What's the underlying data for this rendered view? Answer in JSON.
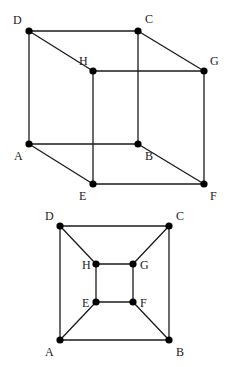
{
  "diagrams": [
    {
      "name": "cube-3d",
      "vertices": [
        {
          "id": "A",
          "x": 29,
          "y": 144,
          "lx": 14,
          "ly": 160
        },
        {
          "id": "B",
          "x": 138,
          "y": 144,
          "lx": 145,
          "ly": 160
        },
        {
          "id": "C",
          "x": 138,
          "y": 31,
          "lx": 145,
          "ly": 23
        },
        {
          "id": "D",
          "x": 29,
          "y": 31,
          "lx": 13,
          "ly": 24
        },
        {
          "id": "E",
          "x": 93,
          "y": 184,
          "lx": 79,
          "ly": 200
        },
        {
          "id": "F",
          "x": 204,
          "y": 184,
          "lx": 210,
          "ly": 200
        },
        {
          "id": "G",
          "x": 204,
          "y": 71,
          "lx": 210,
          "ly": 65
        },
        {
          "id": "H",
          "x": 93,
          "y": 71,
          "lx": 79,
          "ly": 65
        }
      ],
      "edges": [
        [
          "A",
          "B"
        ],
        [
          "B",
          "C"
        ],
        [
          "C",
          "D"
        ],
        [
          "D",
          "A"
        ],
        [
          "E",
          "F"
        ],
        [
          "F",
          "G"
        ],
        [
          "G",
          "H"
        ],
        [
          "H",
          "E"
        ],
        [
          "A",
          "E"
        ],
        [
          "B",
          "F"
        ],
        [
          "C",
          "G"
        ],
        [
          "D",
          "H"
        ]
      ]
    },
    {
      "name": "cube-planar",
      "vertices": [
        {
          "id": "A",
          "x": 60,
          "y": 340,
          "lx": 45,
          "ly": 356
        },
        {
          "id": "B",
          "x": 169,
          "y": 340,
          "lx": 176,
          "ly": 356
        },
        {
          "id": "C",
          "x": 169,
          "y": 226,
          "lx": 176,
          "ly": 220
        },
        {
          "id": "D",
          "x": 60,
          "y": 226,
          "lx": 45,
          "ly": 220
        },
        {
          "id": "E",
          "x": 96,
          "y": 302,
          "lx": 82,
          "ly": 307
        },
        {
          "id": "F",
          "x": 133,
          "y": 302,
          "lx": 140,
          "ly": 307
        },
        {
          "id": "G",
          "x": 133,
          "y": 264,
          "lx": 140,
          "ly": 269
        },
        {
          "id": "H",
          "x": 96,
          "y": 264,
          "lx": 82,
          "ly": 269
        }
      ],
      "edges": [
        [
          "A",
          "B"
        ],
        [
          "B",
          "C"
        ],
        [
          "C",
          "D"
        ],
        [
          "D",
          "A"
        ],
        [
          "E",
          "F"
        ],
        [
          "F",
          "G"
        ],
        [
          "G",
          "H"
        ],
        [
          "H",
          "E"
        ],
        [
          "A",
          "E"
        ],
        [
          "B",
          "F"
        ],
        [
          "C",
          "G"
        ],
        [
          "D",
          "H"
        ]
      ]
    }
  ],
  "style": {
    "vertex_radius": 3.6,
    "edge_color": "#1a1a1a",
    "vertex_color": "#000000"
  }
}
